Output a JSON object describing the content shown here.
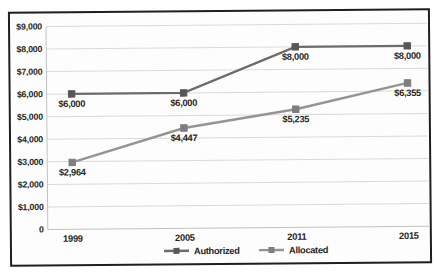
{
  "figure": {
    "background": "#fdfdfd",
    "border_color": "#1f1f1f",
    "label_color": "#262626",
    "gridline_color": "#dadada",
    "axis_line_color": "#c2c2c2"
  },
  "chart_data": {
    "type": "line",
    "title": "",
    "xlabel": "",
    "ylabel": "",
    "categories": [
      "1999",
      "2005",
      "2011",
      "2015"
    ],
    "series": [
      {
        "name": "Authorized",
        "values": [
          6000,
          6000,
          8000,
          8000
        ],
        "labels": [
          "$6,000",
          "$6,000",
          "$8,000",
          "$8,000"
        ],
        "line_color": "#6b6b6b",
        "marker_color": "#575757"
      },
      {
        "name": "Allocated",
        "values": [
          2964,
          4447,
          5235,
          6355
        ],
        "labels": [
          "$2,964",
          "$4,447",
          "$5,235",
          "$6,355"
        ],
        "line_color": "#949494",
        "marker_color": "#7e7e7e"
      }
    ],
    "y_axis": {
      "min": 0,
      "max": 9000,
      "step": 1000,
      "tick_labels": [
        "0",
        "$1,000",
        "$2,000",
        "$3,000",
        "$4,000",
        "$5,000",
        "$6,000",
        "$7,000",
        "$8,000",
        "$9,000"
      ]
    },
    "grid": "horizontal",
    "legend": {
      "position": "bottom-center",
      "entries": [
        "Authorized",
        "Allocated"
      ]
    }
  }
}
